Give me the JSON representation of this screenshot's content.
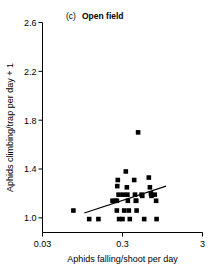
{
  "chart_data": {
    "type": "scatter",
    "panel_letter": "(c)",
    "panel_name": "Open field",
    "xlabel": "Aphids falling/shoot per day",
    "ylabel": "Aphids climbing/trap per day + 1",
    "xscale": "log",
    "yscale": "linear",
    "xlim": [
      0.03,
      3
    ],
    "ylim": [
      0.88,
      2.6
    ],
    "xticks": [
      0.03,
      0.3,
      3
    ],
    "xticklabels": [
      "0.03",
      "0.3",
      "3"
    ],
    "yticks": [
      1.0,
      1.4,
      1.8,
      2.2,
      2.6
    ],
    "yticklabels": [
      "1.0",
      "1.4",
      "1.8",
      "2.2",
      "2.6"
    ],
    "grid": false,
    "legend": null,
    "marker": "square",
    "marker_color": "#000000",
    "points": [
      {
        "x": 0.073,
        "y": 1.06
      },
      {
        "x": 0.115,
        "y": 0.99
      },
      {
        "x": 0.15,
        "y": 0.99
      },
      {
        "x": 0.225,
        "y": 1.14
      },
      {
        "x": 0.243,
        "y": 1.14
      },
      {
        "x": 0.255,
        "y": 1.14
      },
      {
        "x": 0.262,
        "y": 1.31
      },
      {
        "x": 0.258,
        "y": 1.26
      },
      {
        "x": 0.268,
        "y": 1.19
      },
      {
        "x": 0.255,
        "y": 1.06
      },
      {
        "x": 0.272,
        "y": 0.99
      },
      {
        "x": 0.3,
        "y": 0.99
      },
      {
        "x": 0.305,
        "y": 1.19
      },
      {
        "x": 0.315,
        "y": 1.06
      },
      {
        "x": 0.33,
        "y": 1.38
      },
      {
        "x": 0.34,
        "y": 1.25
      },
      {
        "x": 0.345,
        "y": 1.19
      },
      {
        "x": 0.35,
        "y": 1.14
      },
      {
        "x": 0.36,
        "y": 1.06
      },
      {
        "x": 0.37,
        "y": 0.99
      },
      {
        "x": 0.42,
        "y": 1.31
      },
      {
        "x": 0.43,
        "y": 1.19
      },
      {
        "x": 0.44,
        "y": 1.14
      },
      {
        "x": 0.445,
        "y": 1.14
      },
      {
        "x": 0.45,
        "y": 1.06
      },
      {
        "x": 0.47,
        "y": 1.7
      },
      {
        "x": 0.52,
        "y": 1.19
      },
      {
        "x": 0.53,
        "y": 1.18
      },
      {
        "x": 0.56,
        "y": 0.99
      },
      {
        "x": 0.64,
        "y": 1.33
      },
      {
        "x": 0.66,
        "y": 1.25
      },
      {
        "x": 0.68,
        "y": 1.2
      },
      {
        "x": 0.69,
        "y": 1.18
      },
      {
        "x": 0.76,
        "y": 1.19
      },
      {
        "x": 0.79,
        "y": 1.14
      },
      {
        "x": 0.8,
        "y": 0.99
      }
    ],
    "trendline": {
      "x1": 0.1,
      "y1": 1.04,
      "x2": 1.05,
      "y2": 1.26,
      "color": "#000000",
      "style": "solid"
    }
  }
}
